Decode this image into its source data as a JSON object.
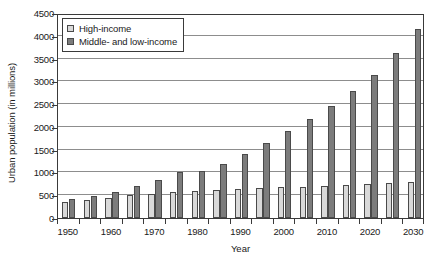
{
  "chart_data": {
    "type": "bar",
    "title": "",
    "subtitle": "",
    "xlabel": "Year",
    "ylabel": "Urban population (in millions)",
    "ylim": [
      0,
      4500
    ],
    "ytick_step": 500,
    "ytick_labels": [
      "4500",
      "4000",
      "3500",
      "3000",
      "2500",
      "2000",
      "1500",
      "1000",
      "500",
      "0"
    ],
    "ytick_values": [
      4500,
      4000,
      3500,
      3000,
      2500,
      2000,
      1500,
      1000,
      500,
      0
    ],
    "grid": "horizontal",
    "legend_position": "top-left",
    "categories": [
      "1950",
      "1955",
      "1960",
      "1965",
      "1970",
      "1975",
      "1980",
      "1985",
      "1990",
      "1995",
      "2000",
      "2005",
      "2010",
      "2015",
      "2020",
      "2025",
      "2030"
    ],
    "xtick_labels_shown": [
      "1950",
      "1960",
      "1970",
      "1980",
      "1990",
      "2000",
      "2010",
      "2020",
      "2030"
    ],
    "series": [
      {
        "name": "High-income",
        "color": "#d9d9d9",
        "values": [
          360,
          400,
          450,
          500,
          520,
          565,
          590,
          610,
          640,
          650,
          675,
          690,
          710,
          730,
          745,
          760,
          800
        ]
      },
      {
        "name": "Middle- and low-income",
        "color": "#7c7c7c",
        "values": [
          410,
          490,
          580,
          710,
          830,
          1010,
          1030,
          1180,
          1400,
          1650,
          1910,
          2180,
          2450,
          2780,
          3130,
          3620,
          4150
        ]
      }
    ]
  },
  "legend": {
    "items": [
      {
        "label": "High-income",
        "swatch": "light"
      },
      {
        "label": "Middle- and low-income",
        "swatch": "dark"
      }
    ]
  },
  "axes": {
    "x_title": "Year",
    "y_title": "Urban population (in millions)"
  }
}
